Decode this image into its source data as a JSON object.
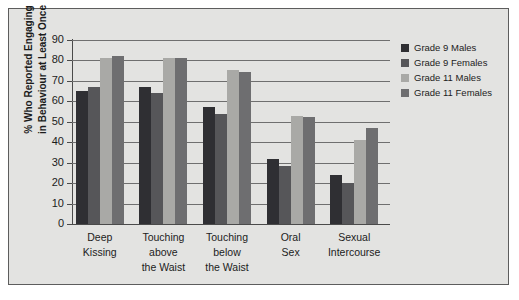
{
  "chart_data": {
    "type": "bar",
    "title": "",
    "subtitle": "",
    "xlabel": "",
    "ylabel": "% Who Reported Engaging in Behaviour at Least Once",
    "ylabel_line1": "% Who Reported Engaging",
    "ylabel_line2": "in Behaviour at Least Once",
    "ylim": [
      0,
      90
    ],
    "ytick_step": 10,
    "yticks": [
      0,
      10,
      20,
      30,
      40,
      50,
      60,
      70,
      80,
      90
    ],
    "grid": "horizontal",
    "legend_position": "right",
    "categories": [
      "Deep Kissing",
      "Touching above the Waist",
      "Touching below the Waist",
      "Oral Sex",
      "Sexual Intercourse"
    ],
    "category_lines": [
      [
        "Deep",
        "Kissing"
      ],
      [
        "Touching",
        "above",
        "the Waist"
      ],
      [
        "Touching",
        "below",
        "the Waist"
      ],
      [
        "Oral",
        "Sex"
      ],
      [
        "Sexual",
        "Intercourse"
      ]
    ],
    "series": [
      {
        "name": "Grade 9 Males",
        "color": "#2f2f33",
        "values": [
          65,
          67,
          57,
          32,
          24
        ]
      },
      {
        "name": "Grade 9 Females",
        "color": "#565659",
        "values": [
          67,
          64,
          54,
          28.5,
          20
        ]
      },
      {
        "name": "Grade 11 Males",
        "color": "#a9a9a6",
        "values": [
          81,
          81,
          75.5,
          53,
          41
        ]
      },
      {
        "name": "Grade 11 Females",
        "color": "#6e6e70",
        "values": [
          82,
          81,
          74.5,
          52.5,
          47
        ]
      }
    ]
  },
  "legend": {
    "items": [
      {
        "label": "Grade 9 Males",
        "color": "#2f2f33"
      },
      {
        "label": "Grade 9 Females",
        "color": "#565659"
      },
      {
        "label": "Grade 11 Males",
        "color": "#a9a9a6"
      },
      {
        "label": "Grade 11 Females",
        "color": "#6e6e70"
      }
    ]
  },
  "colors": {
    "page_background": "#ffffff",
    "figure_background": "#e3e3e1",
    "frame_border": "#5d5d5d",
    "gridline": "#6f6f6f",
    "axis": "#4a4a4a",
    "text": "#1c1c1c"
  }
}
